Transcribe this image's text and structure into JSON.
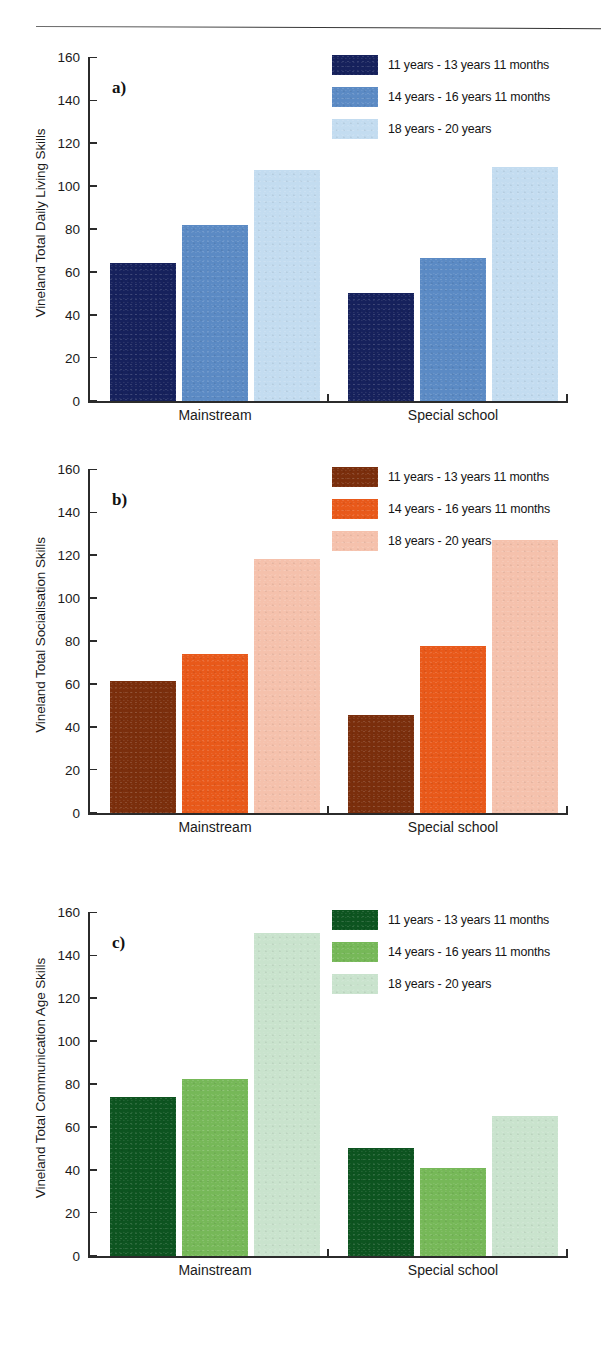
{
  "figure": {
    "panels": [
      {
        "letter": "a)",
        "ylabel": "Vineland Total Daily Living Skills",
        "colors": [
          "#16215c",
          "#5b8ac4",
          "#c3dcf0"
        ]
      },
      {
        "letter": "b)",
        "ylabel": "Vineland Total Socialisation Skills",
        "colors": [
          "#7a2e0c",
          "#e8591a",
          "#f5c1ac"
        ]
      },
      {
        "letter": "c)",
        "ylabel": "Vineland Total Communication Age Skills",
        "colors": [
          "#0d5420",
          "#76b858",
          "#c9e3cd"
        ]
      }
    ],
    "legend_labels": [
      "11 years - 13 years 11 months",
      "14 years - 16 years 11 months",
      "18 years - 20 years"
    ],
    "tick_labels": [
      "0",
      "20",
      "40",
      "60",
      "80",
      "100",
      "120",
      "140",
      "160"
    ],
    "categories": [
      "Mainstream",
      "Special school"
    ]
  },
  "chart_data": [
    {
      "type": "bar",
      "panel": "a)",
      "title": "",
      "xlabel": "",
      "ylabel": "Vineland Total Daily Living Skills",
      "categories": [
        "Mainstream",
        "Special school"
      ],
      "ylim": [
        0,
        160
      ],
      "yticks": [
        0,
        20,
        40,
        60,
        80,
        100,
        120,
        140,
        160
      ],
      "grid": false,
      "legend_position": "top-right",
      "series": [
        {
          "name": "11 years - 13 years 11 months",
          "color": "#16215c",
          "values": [
            64.5,
            50.5
          ]
        },
        {
          "name": "14 years - 16 years 11 months",
          "color": "#5b8ac4",
          "values": [
            82,
            67
          ]
        },
        {
          "name": "18 years - 20 years",
          "color": "#c3dcf0",
          "values": [
            108,
            109
          ]
        }
      ]
    },
    {
      "type": "bar",
      "panel": "b)",
      "title": "",
      "xlabel": "",
      "ylabel": "Vineland Total Socialisation Skills",
      "categories": [
        "Mainstream",
        "Special school"
      ],
      "ylim": [
        0,
        160
      ],
      "yticks": [
        0,
        20,
        40,
        60,
        80,
        100,
        120,
        140,
        160
      ],
      "grid": false,
      "legend_position": "top-right",
      "series": [
        {
          "name": "11 years - 13 years 11 months",
          "color": "#7a2e0c",
          "values": [
            61.5,
            46
          ]
        },
        {
          "name": "14 years - 16 years 11 months",
          "color": "#e8591a",
          "values": [
            74.5,
            78
          ]
        },
        {
          "name": "18 years - 20 years",
          "color": "#f5c1ac",
          "values": [
            118.5,
            127.5
          ]
        }
      ]
    },
    {
      "type": "bar",
      "panel": "c)",
      "title": "",
      "xlabel": "",
      "ylabel": "Vineland Total Communication Age Skills",
      "categories": [
        "Mainstream",
        "Special school"
      ],
      "ylim": [
        0,
        160
      ],
      "yticks": [
        0,
        20,
        40,
        60,
        80,
        100,
        120,
        140,
        160
      ],
      "grid": false,
      "legend_position": "top-right",
      "series": [
        {
          "name": "11 years - 13 years 11 months",
          "color": "#0d5420",
          "values": [
            74.5,
            50.5
          ]
        },
        {
          "name": "14 years - 16 years 11 months",
          "color": "#76b858",
          "values": [
            82.5,
            41
          ]
        },
        {
          "name": "18 years - 20 years",
          "color": "#c9e3cd",
          "values": [
            150.5,
            65.5
          ]
        }
      ]
    }
  ]
}
